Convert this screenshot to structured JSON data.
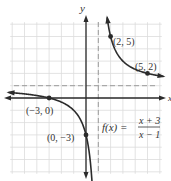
{
  "chart_data": {
    "type": "line",
    "title": "",
    "function_label": "f(x) =",
    "numerator": "x + 3",
    "denominator": "x − 1",
    "xlabel": "x",
    "ylabel": "y",
    "xlim": [
      -6,
      6
    ],
    "ylim": [
      -6,
      6
    ],
    "grid": true,
    "asymptotes": {
      "vertical": 1,
      "horizontal": 1
    },
    "series": [
      {
        "name": "f(x) = (x+3)/(x-1)",
        "domain": "x < 1",
        "x": [
          -6,
          -5,
          -4,
          -3,
          -2,
          -1,
          0,
          0.5,
          0.7
        ],
        "y": [
          0.43,
          0.33,
          0.2,
          0,
          -0.33,
          -1,
          -3,
          -7,
          -12.3
        ]
      },
      {
        "name": "f(x) = (x+3)/(x-1)",
        "domain": "x > 1",
        "x": [
          1.7,
          2,
          3,
          4,
          5,
          6
        ],
        "y": [
          6.7,
          5,
          3,
          2.33,
          2,
          1.8
        ]
      }
    ],
    "points": [
      {
        "label": "(2, 5)",
        "x": 2,
        "y": 5
      },
      {
        "label": "(5, 2)",
        "x": 5,
        "y": 2
      },
      {
        "label": "(−3, 0)",
        "x": -3,
        "y": 0
      },
      {
        "label": "(0, −3)",
        "x": 0,
        "y": -3
      }
    ]
  },
  "labels": {
    "y_axis": "y",
    "x_axis": "x",
    "p1": "(2, 5)",
    "p2": "(5, 2)",
    "p3": "(−3, 0)",
    "p4": "(0, −3)",
    "fx": "f(x) =",
    "num": "x + 3",
    "den": "x − 1"
  },
  "colors": {
    "curve": "#2b2b2b",
    "grid": "#d8d8d8",
    "asymptote": "#9a9a9a",
    "axis": "#2b2b2b"
  }
}
